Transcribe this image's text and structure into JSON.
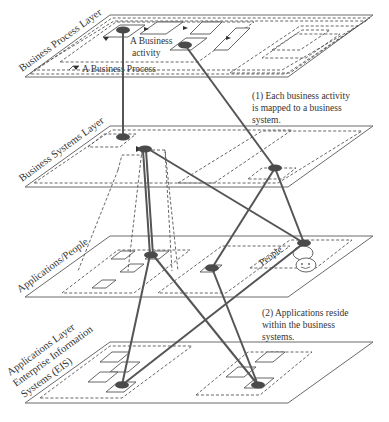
{
  "layers": [
    {
      "id": "business-process",
      "label": "Business Process Layer"
    },
    {
      "id": "business-systems",
      "label": "Business Systems Layer"
    },
    {
      "id": "applications-people",
      "label": "Applications/People"
    },
    {
      "id": "applications-eis",
      "label_lines": [
        "Applications Layer",
        "Enterprise Information",
        "Systems (EIS)"
      ]
    }
  ],
  "inner_labels": {
    "business_activity_line1": "A Business",
    "business_activity_line2": "activity",
    "business_process": "A Business Process",
    "people": "People"
  },
  "notes": {
    "note1": [
      "(1) Each business activity",
      "is mapped to a business",
      "system."
    ],
    "note2": [
      "(2) Applications reside",
      "within the business",
      "systems."
    ]
  },
  "colors": {
    "line": "#555555",
    "node": "#4a4a4a",
    "plane_stroke": "#6a6a6a"
  }
}
